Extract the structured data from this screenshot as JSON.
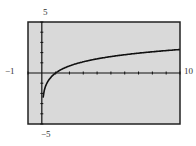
{
  "chart_data": {
    "type": "line",
    "title": "",
    "function": "y = ln(x)",
    "xlabel": "",
    "ylabel": "",
    "xlim": [
      -1,
      10
    ],
    "ylim": [
      -5,
      5
    ],
    "xscale": 1,
    "yscale": 1,
    "grid": false,
    "window_labels": {
      "xmin": "−1",
      "xmax": "10",
      "ymin": "−5",
      "ymax": "5"
    },
    "x": [
      0.1,
      0.2,
      0.5,
      1,
      2,
      3,
      4,
      5,
      6,
      7,
      8,
      9,
      10
    ],
    "y": [
      -2.3,
      -1.61,
      -0.69,
      0,
      0.69,
      1.1,
      1.39,
      1.61,
      1.79,
      1.95,
      2.08,
      2.2,
      2.3
    ]
  },
  "colors": {
    "screen": "#d9d9d9",
    "frame": "#222222",
    "curve": "#111111"
  }
}
